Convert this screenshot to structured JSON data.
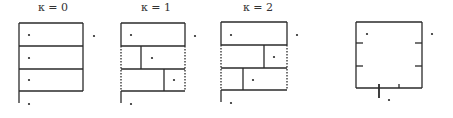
{
  "diagram": {
    "title": "",
    "stroke_color": "#2a2a2a",
    "panels": [
      {
        "id": "k0",
        "label": "κ = 0",
        "label_x": 38,
        "box": {
          "x1": 19,
          "y1": 23,
          "x2": 83,
          "y2": 91
        },
        "rows": [
          23,
          46,
          69,
          91
        ],
        "dividers": [],
        "side_dashed": false,
        "stem": {
          "x": 19,
          "y1": 91,
          "y2": 103
        },
        "dots": [
          [
            29,
            35
          ],
          [
            29,
            58
          ],
          [
            29,
            80
          ],
          [
            94,
            36
          ],
          [
            29,
            104
          ]
        ]
      },
      {
        "id": "k1",
        "label": "κ = 1",
        "label_x": 141,
        "box": {
          "x1": 121,
          "y1": 23,
          "x2": 185,
          "y2": 91
        },
        "rows": [
          23,
          46,
          69,
          91
        ],
        "dividers": [
          {
            "x": 141,
            "y1": 46,
            "y2": 69
          },
          {
            "x": 164,
            "y1": 69,
            "y2": 91
          }
        ],
        "side_dashed": true,
        "stem": {
          "x": 121,
          "y1": 91,
          "y2": 103
        },
        "dots": [
          [
            131,
            35
          ],
          [
            152,
            58
          ],
          [
            174,
            80
          ],
          [
            195,
            36
          ],
          [
            131,
            104
          ]
        ]
      },
      {
        "id": "k2",
        "label": "κ = 2",
        "label_x": 243,
        "box": {
          "x1": 221,
          "y1": 22,
          "x2": 287,
          "y2": 90
        },
        "rows": [
          22,
          45,
          68,
          90
        ],
        "dividers": [
          {
            "x": 264,
            "y1": 45,
            "y2": 68
          },
          {
            "x": 243,
            "y1": 68,
            "y2": 90
          }
        ],
        "side_dashed": true,
        "stem": {
          "x": 221,
          "y1": 90,
          "y2": 102
        },
        "dots": [
          [
            231,
            35
          ],
          [
            274,
            57
          ],
          [
            253,
            80
          ],
          [
            297,
            35
          ],
          [
            231,
            103
          ]
        ]
      },
      {
        "id": "square",
        "label": "",
        "label_x": 0,
        "box": {
          "x1": 356,
          "y1": 22,
          "x2": 422,
          "y2": 88
        },
        "rows": [
          22,
          88
        ],
        "dividers": [],
        "side_dashed": false,
        "ticks": [
          {
            "x1": 356,
            "y1": 43,
            "x2": 363,
            "y2": 43
          },
          {
            "x1": 356,
            "y1": 66,
            "x2": 363,
            "y2": 66
          },
          {
            "x1": 422,
            "y1": 43,
            "x2": 415,
            "y2": 43
          },
          {
            "x1": 422,
            "y1": 66,
            "x2": 415,
            "y2": 66
          },
          {
            "x1": 379,
            "y1": 84,
            "x2": 379,
            "y2": 98
          },
          {
            "x1": 399,
            "y1": 84,
            "x2": 399,
            "y2": 88
          }
        ],
        "dots": [
          [
            367,
            34
          ],
          [
            432,
            34
          ],
          [
            389,
            100
          ]
        ]
      }
    ]
  }
}
